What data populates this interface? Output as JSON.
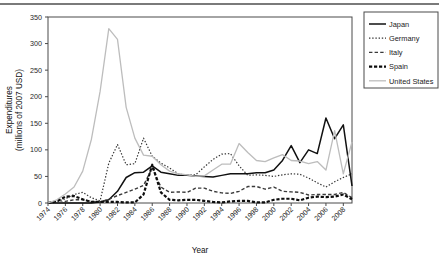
{
  "chart_data": {
    "type": "line",
    "title": "",
    "xlabel": "Year",
    "ylabel": "Expenditures\n(millions of 2007 USD)",
    "ylabel_line1": "Expenditures",
    "ylabel_line2": "(millions of 2007 USD)",
    "xlim": [
      1974,
      2009
    ],
    "ylim": [
      0,
      350
    ],
    "ytick_step": 50,
    "xtick_step": 2,
    "grid": false,
    "legend_position": "right-top",
    "yticks": [
      "0",
      "50",
      "100",
      "150",
      "200",
      "250",
      "300",
      "350"
    ],
    "xticks": [
      "1974",
      "1976",
      "1978",
      "1980",
      "1982",
      "1984",
      "1986",
      "1988",
      "1990",
      "1992",
      "1994",
      "1996",
      "1998",
      "2000",
      "2002",
      "2004",
      "2006",
      "2008"
    ],
    "x": [
      1974,
      1975,
      1976,
      1977,
      1978,
      1979,
      1980,
      1981,
      1982,
      1983,
      1984,
      1985,
      1986,
      1987,
      1988,
      1989,
      1990,
      1991,
      1992,
      1993,
      1994,
      1995,
      1996,
      1997,
      1998,
      1999,
      2000,
      2001,
      2002,
      2003,
      2004,
      2005,
      2006,
      2007,
      2008,
      2009
    ],
    "series": [
      {
        "name": "Japan",
        "style": "solid",
        "color": "#111111",
        "width": 1.5,
        "values": [
          0,
          0,
          0,
          0,
          0,
          0,
          2,
          6,
          22,
          48,
          57,
          58,
          70,
          58,
          55,
          52,
          52,
          51,
          50,
          49,
          52,
          55,
          55,
          55,
          57,
          57,
          62,
          80,
          108,
          76,
          100,
          93,
          160,
          121,
          147,
          32
        ]
      },
      {
        "name": "Germany",
        "style": "dotted",
        "color": "#333333",
        "width": 1.2,
        "values": [
          0,
          2,
          8,
          16,
          20,
          10,
          4,
          75,
          110,
          72,
          74,
          122,
          88,
          75,
          66,
          55,
          52,
          53,
          68,
          82,
          92,
          93,
          70,
          52,
          53,
          52,
          50,
          53,
          55,
          54,
          47,
          38,
          30,
          40,
          48,
          55
        ]
      },
      {
        "name": "Italy",
        "style": "dashed",
        "color": "#3a3a3a",
        "width": 1.4,
        "values": [
          0,
          0,
          3,
          6,
          6,
          3,
          2,
          7,
          14,
          20,
          26,
          33,
          66,
          30,
          20,
          21,
          20,
          28,
          28,
          22,
          19,
          18,
          22,
          31,
          31,
          26,
          30,
          22,
          21,
          20,
          15,
          16,
          16,
          16,
          20,
          10
        ]
      },
      {
        "name": "Spain",
        "style": "thick-dashed",
        "color": "#0d0d0d",
        "width": 2.2,
        "values": [
          0,
          3,
          12,
          13,
          7,
          2,
          2,
          2,
          2,
          1,
          1,
          16,
          72,
          20,
          6,
          5,
          6,
          6,
          4,
          2,
          1,
          3,
          4,
          4,
          1,
          1,
          6,
          8,
          8,
          5,
          10,
          12,
          11,
          12,
          16,
          7
        ]
      },
      {
        "name": "United States",
        "style": "solid",
        "color": "#bdbdbd",
        "width": 1.3,
        "values": [
          0,
          6,
          17,
          30,
          60,
          120,
          210,
          328,
          308,
          180,
          122,
          90,
          88,
          72,
          60,
          55,
          53,
          50,
          51,
          62,
          73,
          73,
          112,
          95,
          80,
          78,
          85,
          91,
          80,
          79,
          74,
          78,
          62,
          136,
          55,
          115
        ]
      }
    ]
  },
  "legend": {
    "items": [
      {
        "label": "Japan"
      },
      {
        "label": "Germany"
      },
      {
        "label": "Italy"
      },
      {
        "label": "Spain"
      },
      {
        "label": "United States"
      }
    ]
  }
}
